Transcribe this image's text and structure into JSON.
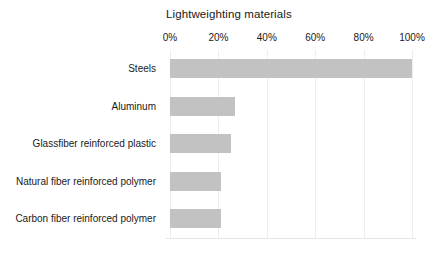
{
  "chart_data": {
    "type": "bar",
    "orientation": "horizontal",
    "title": "Lightweighting materials",
    "xlabel": "",
    "ylabel": "",
    "categories": [
      "Steels",
      "Aluminum",
      "Glassfiber reinforced plastic",
      "Natural fiber reinforced polymer",
      "Carbon fiber reinforced polymer"
    ],
    "values": [
      100,
      27,
      25,
      21,
      21
    ],
    "value_suffix": "%",
    "xlim": [
      0,
      100
    ],
    "xticks": [
      0,
      20,
      40,
      60,
      80,
      100
    ],
    "xtick_labels": [
      "0%",
      "20%",
      "40%",
      "60%",
      "80%",
      "100%"
    ],
    "xaxis_position": "top",
    "grid": true,
    "grid_axis": "x",
    "legend": false,
    "bar_color": "#c2c2c2",
    "gridline_color": "#eceff1",
    "text_color": "#1a1a1a",
    "background_color": "#ffffff"
  }
}
